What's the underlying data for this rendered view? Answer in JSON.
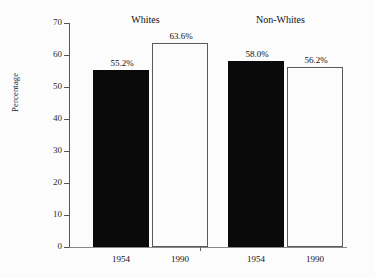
{
  "chart_data": {
    "type": "bar",
    "title": "",
    "xlabel": "",
    "ylabel": "Percentage",
    "ylim": [
      0,
      70
    ],
    "ytick_values": [
      70,
      60,
      50,
      40,
      30,
      20,
      10,
      0
    ],
    "ytick_labels": [
      "70",
      "60",
      "50",
      "40",
      "30",
      "20",
      "10",
      "0"
    ],
    "grid": false,
    "legend": "none",
    "groups": [
      {
        "label": "Whites",
        "categories": [
          "1954",
          "1990"
        ],
        "values": [
          55.2,
          56.2
        ],
        "bars": [
          {
            "category": "1954",
            "value": 55.2,
            "value_label": "55.2%",
            "style": "filled"
          },
          {
            "category": "1990",
            "value": 63.6,
            "value_label": "63.6%",
            "style": "hollow"
          }
        ]
      },
      {
        "label": "Non-Whites",
        "categories": [
          "1954",
          "1990"
        ],
        "bars": [
          {
            "category": "1954",
            "value": 58.0,
            "value_label": "58.0%",
            "style": "filled"
          },
          {
            "category": "1990",
            "value": 56.2,
            "value_label": "56.2%",
            "style": "hollow"
          }
        ]
      }
    ],
    "series": [
      {
        "name": "1954",
        "categories": [
          "Whites",
          "Non-Whites"
        ],
        "values": [
          55.2,
          58.0
        ]
      },
      {
        "name": "1990",
        "categories": [
          "Whites",
          "Non-Whites"
        ],
        "values": [
          63.6,
          56.2
        ]
      }
    ],
    "colors": {
      "filled_bar": "#0a0a0a",
      "hollow_bar_border": "#5a5a5a",
      "hollow_bar_fill": "#fcfcfc",
      "axis": "#555555",
      "text": "#111111",
      "background": "#fcfcfc"
    }
  }
}
